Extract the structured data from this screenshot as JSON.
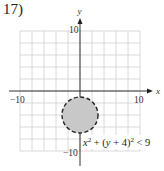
{
  "problem": {
    "number_label": "17)"
  },
  "chart_data": {
    "type": "region",
    "title": "",
    "xlabel": "x",
    "ylabel": "y",
    "xlim": [
      -10,
      10
    ],
    "ylim": [
      -10,
      10
    ],
    "grid": true,
    "grid_step": 2,
    "tick_labels": {
      "x_min": "−10",
      "x_max": "10",
      "y_min": "−10",
      "y_max": "10"
    },
    "inequality": "x^2 + (y + 4)^2 < 9",
    "shape": {
      "kind": "circle",
      "center": [
        0,
        -4
      ],
      "radius": 3,
      "boundary": "dashed",
      "fill": "shaded",
      "fill_color": "#c8c8c8",
      "stroke_color": "#222222"
    },
    "annotation": "x² + (y + 4)² < 9"
  }
}
